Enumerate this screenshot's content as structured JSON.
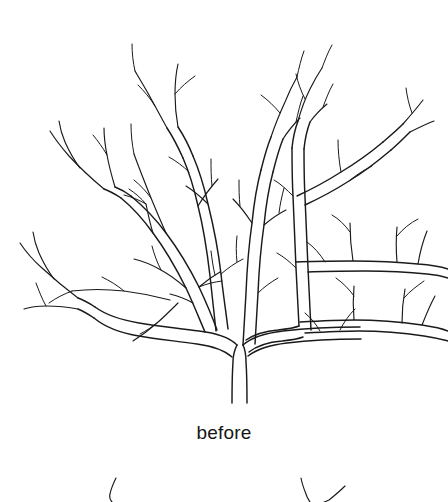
{
  "figure": {
    "name": "bare-deciduous-tree-line-drawing",
    "caption": "before",
    "style": "black-ink-outline-on-white",
    "ink_color": "#1a1a1a",
    "background_color": "#ffffff",
    "stroke_widths": {
      "limb": 1.45,
      "twig": 1.15,
      "hair": 1.0
    },
    "viewbox": "0 0 448 415"
  },
  "caption": {
    "text": "before",
    "font_size_px": 19,
    "color": "#151515",
    "align": "center",
    "top_px": 421
  },
  "tree": {
    "description": "Bare branching tree shown before pruning, drawn as double-line outlined limbs with fine single-stroke twigs.",
    "trunk": {
      "base_y": 402,
      "fork_y": 345,
      "center_x": 240,
      "width_px": 15
    },
    "main_limbs": [
      {
        "name": "left-limb",
        "direction": "up-left",
        "tip_x": 30,
        "tip_y": 232
      },
      {
        "name": "right-limb",
        "direction": "up-right",
        "tip_x": 275,
        "tip_y": 95
      }
    ],
    "outline_paths": [
      "M232,402 L233,370 L234,352 L237,346",
      "M247,402 L246,372 L245,352 L243,346",
      "M237,346 C232,338 222,334 206,331 C183,327 160,324 140,321 C120,318 104,313 92,305",
      "M243,346 C250,337 262,333 280,330 C306,326 332,324 356,322 C386,319 412,314 436,306",
      "M206,331 C205,318 204,300 203,283 C201,258 198,232 194,210",
      "M218,329 C217,312 215,292 213,272 C210,246 206,222 202,203",
      "M280,330 C279,312 278,292 277,270 C276,243 275,215 274,186",
      "M268,331 C267,312 266,290 265,268 C264,240 263,212 262,184",
      "M274,186 C274,170 275,156 277,142 C279,124 282,108 286,95",
      "M262,184 C262,168 263,154 265,140 C267,122 270,106 274,93",
      "M194,210 C190,192 185,172 179,152 C172,128 164,106 155,88",
      "M202,203 C198,186 193,167 187,148 C180,124 172,103 163,86"
    ],
    "branch_nodes": [
      {
        "x": 240,
        "y": 345,
        "label": "main-fork"
      },
      {
        "x": 205,
        "y": 215,
        "label": "limb-crossing"
      },
      {
        "x": 275,
        "y": 165,
        "label": "right-upper-node"
      },
      {
        "x": 32,
        "y": 232,
        "label": "left-outer-node"
      },
      {
        "x": 170,
        "y": 290,
        "label": "lower-left-node"
      }
    ],
    "twig_count_estimate": 54,
    "canopy_extent": {
      "left": 4,
      "right": 448,
      "top": 24,
      "bottom": 402
    }
  },
  "next_figure_fragments": [
    {
      "name": "left-twig-fragment",
      "x": 112,
      "y": 478
    },
    {
      "name": "right-vertical-fragment",
      "x": 302,
      "y": 478
    },
    {
      "name": "right-diagonal-fragment",
      "x": 330,
      "y": 487
    }
  ]
}
